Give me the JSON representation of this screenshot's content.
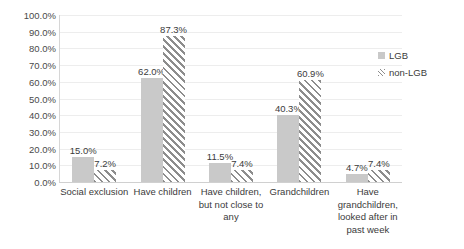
{
  "chart_data": {
    "type": "bar",
    "title": "",
    "subtitle": "",
    "xlabel": "",
    "ylabel": "",
    "ylim": [
      0,
      100
    ],
    "grid": true,
    "legend_position": "right",
    "categories": [
      "Social exclusion",
      "Have children",
      "Have children, but not close to any",
      "Grandchildren",
      "Have grandchildren, looked after in past week"
    ],
    "category_lines": [
      [
        "Social exclusion"
      ],
      [
        "Have children"
      ],
      [
        "Have children,",
        "but not close to",
        "any"
      ],
      [
        "Grandchildren"
      ],
      [
        "Have",
        "grandchildren,",
        "looked after in",
        "past week"
      ]
    ],
    "series": [
      {
        "name": "LGB",
        "values": [
          15.0,
          62.0,
          11.5,
          40.3,
          4.7
        ],
        "labels": [
          "15.0%",
          "62.0%",
          "11.5%",
          "40.3%",
          "4.7%"
        ],
        "color": "#c9c9c9",
        "pattern": "solid"
      },
      {
        "name": "non-LGB",
        "values": [
          7.2,
          87.3,
          7.4,
          60.9,
          7.4
        ],
        "labels": [
          "7.2%",
          "87.3%",
          "7.4%",
          "60.9%",
          "7.4%"
        ],
        "color": "#8d8d8d",
        "pattern": "diagonal-hatch"
      }
    ],
    "ytick_labels": [
      "100.0%",
      "90.0%",
      "80.0%",
      "70.0%",
      "60.0%",
      "50.0%",
      "40.0%",
      "30.0%",
      "20.0%",
      "10.0%",
      "0.0%"
    ],
    "ytick_values": [
      100,
      90,
      80,
      70,
      60,
      50,
      40,
      30,
      20,
      10,
      0
    ]
  },
  "legend": {
    "items": [
      {
        "label": "LGB",
        "swatch": "solid-gray-swatch"
      },
      {
        "label": "non-LGB",
        "swatch": "hatched-swatch"
      }
    ]
  }
}
